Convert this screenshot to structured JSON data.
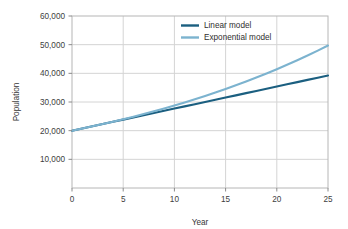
{
  "chart_data": {
    "type": "line",
    "title": "",
    "xlabel": "Year",
    "ylabel": "Population",
    "xlim": [
      0,
      25
    ],
    "ylim": [
      0,
      60000
    ],
    "x_ticks": [
      0,
      5,
      10,
      15,
      20,
      25
    ],
    "x_tick_labels": [
      "0",
      "5",
      "10",
      "15",
      "20",
      "25"
    ],
    "y_ticks": [
      10000,
      20000,
      30000,
      40000,
      50000,
      60000
    ],
    "y_tick_labels": [
      "10,000",
      "20,000",
      "30,000",
      "40,000",
      "50,000",
      "60,000"
    ],
    "grid": true,
    "grid_axis": "both",
    "legend_position": "top-right",
    "x": [
      0,
      1,
      2,
      3,
      4,
      5,
      6,
      7,
      8,
      9,
      10,
      11,
      12,
      13,
      14,
      15,
      16,
      17,
      18,
      19,
      20,
      21,
      22,
      23,
      24,
      25
    ],
    "series": [
      {
        "name": "Linear model",
        "color": "#1b5f80",
        "width": 2.1,
        "values": [
          20000,
          20770,
          21540,
          22310,
          23080,
          23850,
          24620,
          25390,
          26160,
          26930,
          27700,
          28470,
          29240,
          30010,
          30780,
          31550,
          32320,
          33090,
          33860,
          34630,
          35400,
          36170,
          36940,
          37710,
          38480,
          39250
        ]
      },
      {
        "name": "Exponential model",
        "color": "#7cb3cf",
        "width": 2.1,
        "values": [
          20000,
          20740,
          21510,
          22310,
          23140,
          24000,
          24890,
          25810,
          26770,
          27760,
          28790,
          29860,
          30970,
          32120,
          33310,
          34540,
          35820,
          37150,
          38530,
          39960,
          41440,
          42980,
          44570,
          46220,
          47930,
          49710
        ]
      }
    ]
  },
  "axes": {
    "ylabel": "Population",
    "xlabel": "Year"
  },
  "legend": {
    "entries": [
      {
        "label": "Linear model",
        "color": "#1b5f80"
      },
      {
        "label": "Exponential model",
        "color": "#7cb3cf"
      }
    ]
  },
  "style": {
    "background": "#ffffff",
    "grid_color": "#d4d4d4",
    "frame_color": "#b6b6b6",
    "tick_color": "#8a8a8a",
    "text_color": "#3a3a3a"
  }
}
